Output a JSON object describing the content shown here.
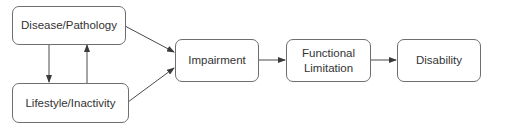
{
  "diagram": {
    "type": "flowchart",
    "nodes": [
      {
        "id": "disease",
        "label": "Disease/Pathology"
      },
      {
        "id": "lifestyle",
        "label": "Lifestyle/Inactivity"
      },
      {
        "id": "impairment",
        "label": "Impairment"
      },
      {
        "id": "functional",
        "label": "Functional\nLimitation"
      },
      {
        "id": "disability",
        "label": "Disability"
      }
    ],
    "edges": [
      {
        "from": "disease",
        "to": "lifestyle"
      },
      {
        "from": "lifestyle",
        "to": "disease"
      },
      {
        "from": "disease",
        "to": "impairment"
      },
      {
        "from": "lifestyle",
        "to": "impairment"
      },
      {
        "from": "impairment",
        "to": "functional"
      },
      {
        "from": "functional",
        "to": "disability"
      }
    ],
    "colors": {
      "border": "#6e6e6e",
      "arrow": "#4a4a4a",
      "text": "#333333",
      "background": "#ffffff"
    }
  }
}
